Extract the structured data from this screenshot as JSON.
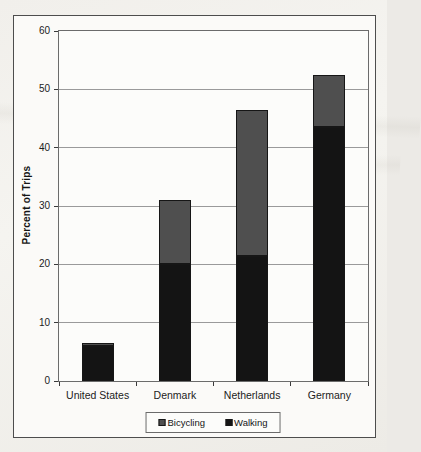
{
  "chart_data": {
    "type": "bar",
    "stacked": true,
    "title": "",
    "xlabel": "",
    "ylabel": "Percent of Trips",
    "categories": [
      "United States",
      "Denmark",
      "Netherlands",
      "Germany"
    ],
    "series": [
      {
        "name": "Walking",
        "color": "#141414",
        "values": [
          6,
          20,
          21.5,
          43.5
        ]
      },
      {
        "name": "Bicycling",
        "color": "#4f4f4f",
        "values": [
          0.5,
          11,
          25,
          9
        ]
      }
    ],
    "totals": [
      6.5,
      31,
      46.5,
      52.5
    ],
    "ylim": [
      0,
      60
    ],
    "yticks": [
      0,
      10,
      20,
      30,
      40,
      50,
      60
    ],
    "grid": "horizontal",
    "legend_position": "bottom-center",
    "legend": [
      {
        "label": "Bicycling",
        "color": "#4f4f4f"
      },
      {
        "label": "Walking",
        "color": "#141414"
      }
    ]
  },
  "figure": {
    "paper_color": "#fbfaf8",
    "border_color": "#4d4d4d",
    "gridline_color": "#9a9a9a"
  }
}
